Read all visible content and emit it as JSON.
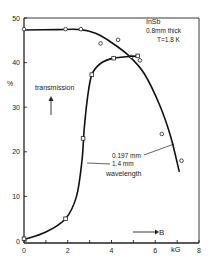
{
  "chart_data": {
    "type": "line",
    "title": "",
    "xlabel": "B",
    "xunit": "kG",
    "ylabel": "%",
    "xlim": [
      0,
      8
    ],
    "ylim": [
      0,
      50
    ],
    "xticks": [
      0,
      2,
      4,
      6,
      8
    ],
    "yticks": [
      0,
      10,
      20,
      30,
      40,
      50
    ],
    "grid": false,
    "annotations": {
      "sample_line1": "InSb",
      "sample_line2": "0.8mm  thick",
      "sample_line3": "T=1.8 K",
      "transmission": "transmission",
      "wl1": "0.197 mm",
      "wl2": "1.4    mm",
      "wl3": "wavelength",
      "b_arrow": "B"
    },
    "series": [
      {
        "name": "0.197 mm",
        "marker": "circle",
        "points": [
          [
            0,
            47.5
          ],
          [
            1.9,
            47.5
          ],
          [
            2.6,
            47.5
          ],
          [
            3.5,
            44.3
          ],
          [
            4.3,
            45.1
          ],
          [
            4.9,
            41.3
          ],
          [
            5.3,
            40.5
          ],
          [
            6.3,
            24.0
          ],
          [
            7.2,
            18.0
          ]
        ],
        "curve": [
          [
            0,
            47.3
          ],
          [
            1.5,
            47.4
          ],
          [
            2.6,
            47.4
          ],
          [
            3.3,
            46.5
          ],
          [
            4.0,
            44.5
          ],
          [
            4.8,
            41.5
          ],
          [
            5.5,
            37.5
          ],
          [
            6.2,
            30.5
          ],
          [
            6.7,
            23.5
          ],
          [
            7.1,
            15.5
          ]
        ]
      },
      {
        "name": "1.4 mm",
        "marker": "square",
        "points": [
          [
            0,
            0.5
          ],
          [
            1.9,
            5.0
          ],
          [
            2.7,
            23.0
          ],
          [
            3.1,
            37.3
          ],
          [
            4.1,
            41.0
          ],
          [
            5.2,
            41.5
          ]
        ],
        "curve": [
          [
            0,
            0.3
          ],
          [
            1.0,
            2.0
          ],
          [
            1.9,
            5.0
          ],
          [
            2.4,
            10.0
          ],
          [
            2.65,
            18.0
          ],
          [
            2.75,
            25.0
          ],
          [
            2.9,
            32.0
          ],
          [
            3.1,
            37.3
          ],
          [
            3.5,
            39.8
          ],
          [
            4.1,
            41.0
          ],
          [
            5.2,
            41.5
          ]
        ]
      }
    ]
  }
}
